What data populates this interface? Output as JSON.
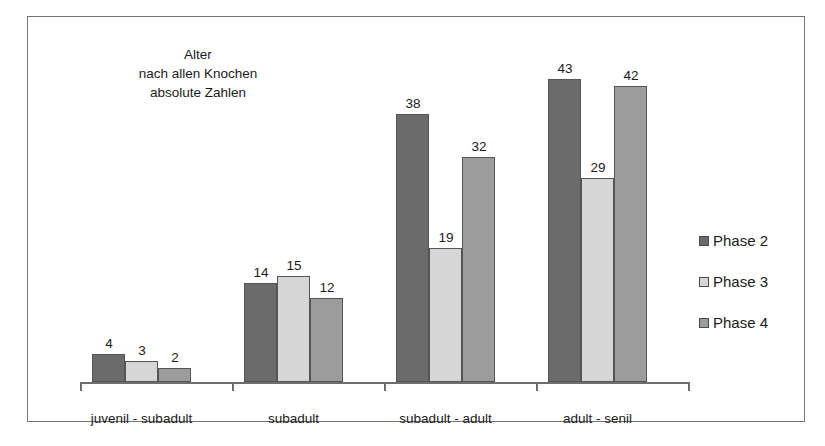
{
  "chart_data": {
    "type": "bar",
    "title": "Alter\nnach allen Knochen\nabsolute Zahlen",
    "title_lines": [
      "Alter",
      "nach allen Knochen",
      "absolute Zahlen"
    ],
    "xlabel": "",
    "ylabel": "",
    "ylim": [
      0,
      49
    ],
    "grid": false,
    "legend_position": "right",
    "categories": [
      "juvenil - subadult",
      "subadult",
      "subadult - adult",
      "adult - senil"
    ],
    "series": [
      {
        "name": "Phase 2",
        "color": "#6b6b6b",
        "values": [
          4,
          14,
          38,
          43
        ]
      },
      {
        "name": "Phase 3",
        "color": "#d6d6d6",
        "values": [
          3,
          15,
          19,
          29
        ]
      },
      {
        "name": "Phase 4",
        "color": "#9c9c9c",
        "values": [
          2,
          12,
          32,
          42
        ]
      }
    ],
    "data_labels": [
      [
        "4",
        "3",
        "2"
      ],
      [
        "14",
        "15",
        "12"
      ],
      [
        "38",
        "19",
        "32"
      ],
      [
        "43",
        "29",
        "42"
      ]
    ]
  },
  "legend": {
    "items": [
      {
        "label": "Phase 2",
        "color": "#6b6b6b"
      },
      {
        "label": "Phase 3",
        "color": "#d6d6d6"
      },
      {
        "label": "Phase 4",
        "color": "#9c9c9c"
      }
    ]
  },
  "axis": {
    "line_color": "#6e6e6e",
    "tick_count": 5
  }
}
